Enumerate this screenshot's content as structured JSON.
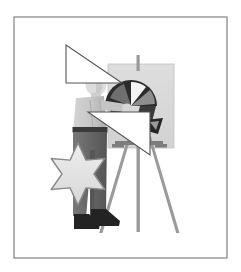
{
  "image": {
    "title": "Artist Painting at Easel",
    "kind": "grayscale-clipart-illustration",
    "width": 241,
    "height": 272,
    "background_color": "#ffffff"
  },
  "frame": {
    "name": "border-frame",
    "x": 14,
    "y": 17,
    "width": 213,
    "height": 241,
    "stroke_color": "#808080",
    "stroke_width": 1.2,
    "fill": "none"
  },
  "palette": {
    "background": "#ffffff",
    "frame_gray": "#808080",
    "canvas_board": "#d9d9d9",
    "canvas_board_edge": "#c0c0c0",
    "shirt_light": "#cccccc",
    "shirt_shadow": "#b8b8b8",
    "pants_dark": "#6e6e6e",
    "pants_shadow": "#5a5a5a",
    "belt_dark": "#3a3a3a",
    "shoe_black": "#232323",
    "hair_black": "#1a1a1a",
    "skin_light": "#e0e0e0",
    "easel_wood": "#9a9a9a",
    "easel_wood_dark": "#7d7d7d",
    "star_fill": "#e2e2e2",
    "star_stroke": "#8a8a8a",
    "triangle_fill": "#ffffff",
    "triangle_stroke": "#555555",
    "fan_dark": "#2b2b2b",
    "fan_mid": "#6a6a6a",
    "fan_light": "#b5b5b5"
  },
  "elements": {
    "canvas_board": {
      "name": "easel-canvas-board",
      "x": 108,
      "y": 64,
      "width": 66,
      "height": 84
    },
    "easel": {
      "name": "easel-stand",
      "post_top": {
        "x": 137,
        "y": 56,
        "width": 3,
        "height": 14
      },
      "center_leg": {
        "x1": 139,
        "y1": 100,
        "x2": 139,
        "y2": 230
      },
      "left_leg": {
        "x1": 133,
        "y1": 120,
        "x2": 99,
        "y2": 232
      },
      "right_leg": {
        "x1": 145,
        "y1": 120,
        "x2": 178,
        "y2": 232
      },
      "crossbar": {
        "x1": 117,
        "y1": 143,
        "x2": 162,
        "y2": 143
      }
    },
    "figure": {
      "name": "artist-figure",
      "head": {
        "cx": 95,
        "cy": 82,
        "rx": 10,
        "ry": 12
      },
      "shirt": {
        "x": 74,
        "y": 86,
        "width": 30,
        "height": 44
      },
      "belt": {
        "x": 73,
        "y": 126,
        "width": 32,
        "height": 5
      },
      "pants": {
        "x": 73,
        "y": 131,
        "width": 32,
        "height": 88
      },
      "shoes": [
        {
          "cx": 85,
          "cy": 223,
          "rx": 13,
          "ry": 6
        },
        {
          "cx": 104,
          "cy": 219,
          "rx": 13,
          "ry": 6
        }
      ]
    },
    "fan_motif": {
      "name": "dark-fan-motif",
      "cx": 131,
      "cy": 104,
      "radius": 26
    },
    "star": {
      "name": "six-pointed-star",
      "cx": 78,
      "cy": 174,
      "outer_radius": 31,
      "inner_radius": 16,
      "points": 6,
      "rotation_deg": 0
    },
    "triangle_upper": {
      "name": "upper-white-triangle",
      "points": "66,45 66,83 122,83",
      "description": "right triangle, right angle at bottom-left"
    },
    "triangle_lower": {
      "name": "lower-white-triangle",
      "points": "88,112 150,112 150,155",
      "description": "right triangle, right angle at top-right"
    }
  }
}
